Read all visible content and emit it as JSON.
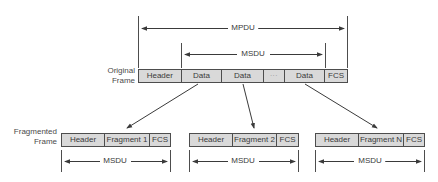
{
  "diagram": {
    "colors": {
      "box_fill": "#d9d9d9",
      "line": "#4d4d4d",
      "text": "#3a3a3a"
    },
    "original_frame": {
      "label_line1": "Original",
      "label_line2": "Frame",
      "segments": [
        {
          "text": "Header",
          "x": 138,
          "w": 43
        },
        {
          "text": "Data",
          "x": 181,
          "w": 41
        },
        {
          "text": "Data",
          "x": 222,
          "w": 42
        },
        {
          "text": "···",
          "x": 264,
          "w": 21
        },
        {
          "text": "Data",
          "x": 285,
          "w": 41
        },
        {
          "text": "FCS",
          "x": 326,
          "w": 22
        }
      ],
      "mpdu_span": {
        "label": "MPDU"
      },
      "msdu_span": {
        "label": "MSDU"
      }
    },
    "fragmented_frame": {
      "label_line1": "Fragmented",
      "label_line2": "Frame",
      "fragments": [
        {
          "header": "Header",
          "body": "Fragment 1",
          "fcs": "FCS",
          "msdu_label": "MSDU"
        },
        {
          "header": "Header",
          "body": "Fragment 2",
          "fcs": "FCS",
          "msdu_label": "MSDU"
        },
        {
          "header": "Header",
          "body": "Fragment N",
          "fcs": "FCS",
          "msdu_label": "MSDU"
        }
      ]
    }
  }
}
